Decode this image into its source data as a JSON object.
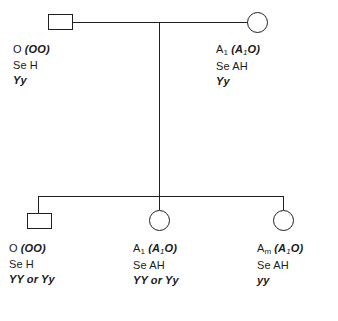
{
  "diagram": {
    "type": "pedigree-chart",
    "title": "",
    "generations": 2,
    "line_color": "#231f20",
    "background": "#ffffff"
  },
  "generation_1": {
    "father": {
      "symbol": "square",
      "sex": "male",
      "label": {
        "phenotype": "O",
        "genotype_paren": "(OO)",
        "secretor_line": "Se H",
        "lewis_line": "Yy"
      }
    },
    "mother": {
      "symbol": "circle",
      "sex": "female",
      "label": {
        "phenotype_base": "A",
        "phenotype_sub": "1",
        "genotype_open": "(A",
        "genotype_sub": "1",
        "genotype_close": "O)",
        "secretor_line": "Se AH",
        "lewis_line": "Yy"
      }
    }
  },
  "generation_2": {
    "children": [
      {
        "symbol": "square",
        "sex": "male",
        "label": {
          "phenotype": "O",
          "genotype_paren": "(OO)",
          "secretor_line": "Se H",
          "lewis_line": "YY or Yy"
        }
      },
      {
        "symbol": "circle",
        "sex": "female",
        "label": {
          "phenotype_base": "A",
          "phenotype_sub": "1",
          "genotype_open": "(A",
          "genotype_sub": "1",
          "genotype_close": "O)",
          "secretor_line": "Se AH",
          "lewis_line": "YY or Yy"
        }
      },
      {
        "symbol": "circle",
        "sex": "female",
        "label": {
          "phenotype_base": "A",
          "phenotype_sub": "m",
          "genotype_open": "(A",
          "genotype_sub": "1",
          "genotype_close": "O)",
          "secretor_line": "Se AH",
          "lewis_line": "yy"
        }
      }
    ]
  }
}
